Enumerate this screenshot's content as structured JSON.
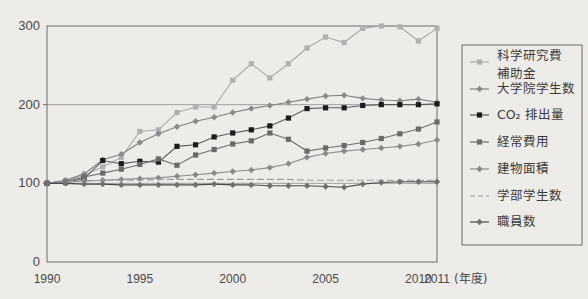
{
  "chart_data": {
    "type": "line",
    "title": "",
    "xlabel": "(年度)",
    "ylabel": "",
    "xlim": [
      1990,
      2011
    ],
    "ylim": [
      0,
      300
    ],
    "grid": true,
    "legend_position": "right",
    "x": [
      1990,
      1991,
      1992,
      1993,
      1994,
      1995,
      1996,
      1997,
      1998,
      1999,
      2000,
      2001,
      2002,
      2003,
      2004,
      2005,
      2006,
      2007,
      2008,
      2009,
      2010,
      2011
    ],
    "xtick_labels": [
      "1990",
      "1995",
      "2000",
      "2005",
      "2010",
      "2011"
    ],
    "xtick_values": [
      1990,
      1995,
      2000,
      2005,
      2010,
      2011
    ],
    "ytick_labels": [
      "0",
      "100",
      "200",
      "300"
    ],
    "ytick_values": [
      0,
      100,
      200,
      300
    ],
    "unit_note": "(年度)",
    "series": [
      {
        "name": "科学研究費補助金",
        "color": "#a8a8a8",
        "marker": "square",
        "marker_color": "#b0b0b0",
        "dash": "none",
        "values": [
          100,
          103,
          110,
          121,
          133,
          166,
          168,
          190,
          197,
          197,
          231,
          252,
          234,
          252,
          272,
          286,
          279,
          297,
          300,
          299,
          281,
          297
        ]
      },
      {
        "name": "大学院学生数",
        "color": "#808080",
        "marker": "diamond",
        "marker_color": "#8a8a8a",
        "dash": "none",
        "values": [
          100,
          104,
          112,
          130,
          137,
          152,
          163,
          172,
          179,
          184,
          190,
          195,
          199,
          203,
          207,
          211,
          212,
          208,
          206,
          205,
          207,
          203
        ]
      },
      {
        "name": "CO₂ 排出量",
        "color": "#5a5a5a",
        "marker": "square",
        "marker_color": "#1c1c1c",
        "dash": "none",
        "values": [
          100,
          101,
          106,
          129,
          125,
          128,
          127,
          147,
          149,
          159,
          164,
          168,
          173,
          183,
          195,
          196,
          196,
          199,
          200,
          200,
          200,
          201
        ]
      },
      {
        "name": "経常費用",
        "color": "#6e6e6e",
        "marker": "square",
        "marker_color": "#6a6a6a",
        "dash": "none",
        "values": [
          100,
          102,
          108,
          113,
          118,
          124,
          131,
          123,
          136,
          143,
          150,
          154,
          164,
          156,
          141,
          145,
          148,
          152,
          157,
          163,
          169,
          178
        ]
      },
      {
        "name": "建物面積",
        "color": "#8e8e8e",
        "marker": "diamond",
        "marker_color": "#8a8a8a",
        "dash": "none",
        "values": [
          100,
          101,
          103,
          104,
          105,
          106,
          107,
          109,
          111,
          113,
          115,
          117,
          120,
          125,
          133,
          138,
          141,
          143,
          145,
          147,
          150,
          155
        ]
      },
      {
        "name": "学部学生数",
        "color": "#9a9a9a",
        "marker": "none",
        "marker_color": "#9a9a9a",
        "dash": "7,3",
        "values": [
          100,
          102,
          103,
          104,
          104,
          104,
          105,
          105,
          105,
          105,
          105,
          105,
          105,
          105,
          104,
          104,
          104,
          104,
          104,
          104,
          104,
          104
        ]
      },
      {
        "name": "職員数",
        "color": "#4a4a4a",
        "marker": "diamond",
        "marker_color": "#707070",
        "dash": "none",
        "values": [
          100,
          100,
          99,
          99,
          98,
          98,
          98,
          98,
          98,
          99,
          98,
          98,
          97,
          97,
          97,
          96,
          95,
          99,
          101,
          102,
          102,
          102
        ]
      }
    ]
  },
  "legend": {
    "items": [
      {
        "label": "科学研究費\n補助金",
        "line1": "科学研究費",
        "line2": "補助金"
      },
      {
        "label": "大学院学生数",
        "line1": "大学院学生数",
        "line2": ""
      },
      {
        "label": "CO₂ 排出量",
        "line1": "CO₂ 排出量",
        "line2": ""
      },
      {
        "label": "経常費用",
        "line1": "経常費用",
        "line2": ""
      },
      {
        "label": "建物面積",
        "line1": "建物面積",
        "line2": ""
      },
      {
        "label": "学部学生数",
        "line1": "学部学生数",
        "line2": ""
      },
      {
        "label": "職員数",
        "line1": "職員数",
        "line2": ""
      }
    ]
  },
  "axis": {
    "x_end_label": "2011",
    "x_unit": "(年度)"
  },
  "colors": {
    "background": "#eeece8",
    "frame": "#6b6b6b",
    "text": "#4a4a4a"
  }
}
